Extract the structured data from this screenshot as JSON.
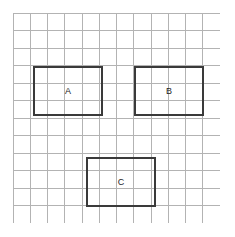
{
  "figure": {
    "title": "",
    "background_color": "#ffffff",
    "width": 235,
    "height": 237
  },
  "grid": {
    "name": "square-grid",
    "columns": 12,
    "rows": 12,
    "cell_width": 17.25,
    "cell_height": 17.5,
    "line_color": "#b3b3b3",
    "line_width": 1,
    "origin_x": 13,
    "origin_y": 13,
    "total_width": 207,
    "total_height": 210
  },
  "shapes": [
    {
      "label": "A",
      "type": "rectangle",
      "grid_col_start": 1,
      "grid_row_start": 3,
      "width_cells": 4,
      "height_cells": 3,
      "x": 33,
      "y": 66,
      "width": 70,
      "height": 50,
      "stroke_color": "#3a3a3a",
      "stroke_width": 2,
      "fill": "none"
    },
    {
      "label": "B",
      "type": "rectangle",
      "grid_col_start": 7,
      "grid_row_start": 3,
      "width_cells": 4,
      "height_cells": 3,
      "x": 134,
      "y": 66,
      "width": 70,
      "height": 50,
      "stroke_color": "#3a3a3a",
      "stroke_width": 2,
      "fill": "none"
    },
    {
      "label": "C",
      "type": "rectangle",
      "grid_col_start": 4,
      "grid_row_start": 8,
      "width_cells": 4,
      "height_cells": 3,
      "x": 86,
      "y": 157,
      "width": 70,
      "height": 50,
      "stroke_color": "#3a3a3a",
      "stroke_width": 2,
      "fill": "none"
    }
  ]
}
